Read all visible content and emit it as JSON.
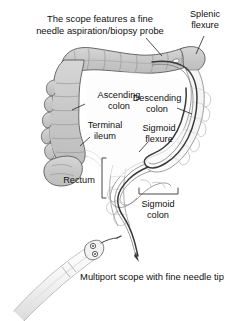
{
  "figure": {
    "background_color": "#ffffff",
    "ink_color": "#111111",
    "colon_fill_shaded": "#c9c9c9",
    "colon_fill_light": "#fdfdfd",
    "colon_outline": "#5a5a5a",
    "scope_color": "#3a3a3a"
  },
  "captions": {
    "top": {
      "line1": "The scope features a fine",
      "line2": "needle aspiration/biopsy probe"
    },
    "bottom": {
      "line1": "Multiport scope with fine needle tip"
    }
  },
  "labels": [
    {
      "id": "splenic-flexure",
      "line1": "Splenic",
      "line2": "flexure"
    },
    {
      "id": "ascending-colon",
      "line1": "Ascending",
      "line2": "colon"
    },
    {
      "id": "descending-colon",
      "line1": "Descending",
      "line2": "colon"
    },
    {
      "id": "terminal-ileum",
      "line1": "Terminal",
      "line2": "ileum"
    },
    {
      "id": "sigmoid-flexure",
      "line1": "Sigmoid",
      "line2": "flexure"
    },
    {
      "id": "rectum",
      "line1": "Rectum",
      "line2": ""
    },
    {
      "id": "sigmoid-colon",
      "line1": "Sigmoid",
      "line2": "colon"
    }
  ],
  "anatomy_parts": [
    "transverse-colon",
    "ascending-colon",
    "cecum",
    "terminal-ileum",
    "splenic-flexure",
    "descending-colon",
    "sigmoid-flexure",
    "sigmoid-colon",
    "rectum"
  ],
  "scope_inset": {
    "name": "multiport-scope",
    "port_count": 2,
    "needle": "fine-needle-tip"
  }
}
